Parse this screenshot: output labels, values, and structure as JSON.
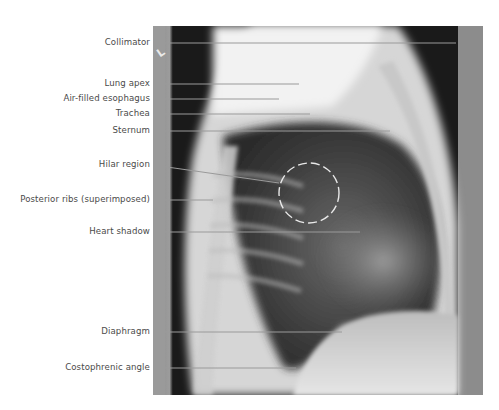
{
  "figure": {
    "marker_letter": "L",
    "labels": [
      {
        "id": "collimator",
        "text": "Collimator",
        "y": 43,
        "line": {
          "x1": 153,
          "y1": 43,
          "x2": 456,
          "y2": 43
        }
      },
      {
        "id": "lung-apex",
        "text": "Lung apex",
        "y": 84,
        "line": {
          "x1": 153,
          "y1": 84,
          "x2": 299,
          "y2": 84
        }
      },
      {
        "id": "air-filled-esophagus",
        "text": "Air-filled esophagus",
        "y": 99,
        "line": {
          "x1": 153,
          "y1": 99,
          "x2": 279,
          "y2": 99
        }
      },
      {
        "id": "trachea",
        "text": "Trachea",
        "y": 114,
        "line": {
          "x1": 153,
          "y1": 114,
          "x2": 310,
          "y2": 114
        }
      },
      {
        "id": "sternum",
        "text": "Sternum",
        "y": 131,
        "line": {
          "x1": 153,
          "y1": 131,
          "x2": 390,
          "y2": 131
        }
      },
      {
        "id": "hilar-region",
        "text": "Hilar region",
        "y": 165,
        "line": {
          "x1": 153,
          "y1": 165,
          "x2": 279,
          "y2": 183
        }
      },
      {
        "id": "posterior-ribs",
        "text": "Posterior ribs (superimposed)",
        "y": 200,
        "line": {
          "x1": 153,
          "y1": 200,
          "x2": 213,
          "y2": 200
        }
      },
      {
        "id": "heart-shadow",
        "text": "Heart shadow",
        "y": 232,
        "line": {
          "x1": 153,
          "y1": 232,
          "x2": 360,
          "y2": 232
        }
      },
      {
        "id": "diaphragm",
        "text": "Diaphragm",
        "y": 332,
        "line": {
          "x1": 153,
          "y1": 332,
          "x2": 342,
          "y2": 332
        }
      },
      {
        "id": "costophrenic-angle",
        "text": "Costophrenic angle",
        "y": 368,
        "line": {
          "x1": 153,
          "y1": 368,
          "x2": 296,
          "y2": 368
        }
      }
    ],
    "hilar_circle": {
      "cx": 309,
      "cy": 193,
      "r": 30
    },
    "colors": {
      "label_text": "#4a4a4a",
      "leader_line": "#9a9a9a",
      "circle": "#e8e8e8"
    }
  }
}
